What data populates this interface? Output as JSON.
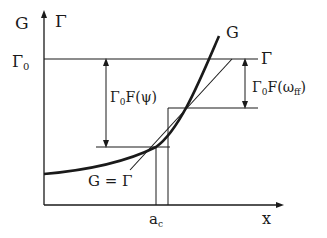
{
  "diagram": {
    "type": "G-Gamma crack growth diagram",
    "labels": {
      "y_axis_G": "G",
      "y_axis_gamma": "Γ",
      "gamma0": "Γ",
      "gamma0_sub": "0",
      "curve_G": "G",
      "line_gamma": "Γ",
      "left_gap": "Γ",
      "left_gap_sub": "0",
      "left_gap_fn": "F(ψ)",
      "right_gap": "Γ",
      "right_gap_sub": "0",
      "right_gap_fn_open": "F(ω",
      "right_gap_fn_sub": "ff",
      "right_gap_fn_close": ")",
      "equality": "G = Γ",
      "x_tick_ac": "a",
      "x_tick_ac_sub": "c",
      "x_axis": "x"
    },
    "colors": {
      "ink": "#1a1a1a",
      "background": "#ffffff"
    }
  }
}
